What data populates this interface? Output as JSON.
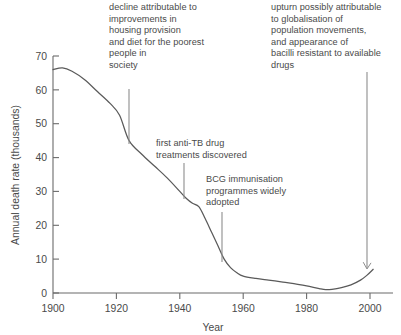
{
  "chart_data": {
    "type": "line",
    "title": "",
    "xlabel": "Year",
    "ylabel": "Annual death rate (thousands)",
    "xlim": [
      1900,
      2001
    ],
    "ylim": [
      0,
      70
    ],
    "grid": false,
    "legend": "none",
    "xticks": [
      "1900",
      "1920",
      "1940",
      "1960",
      "1980",
      "2000"
    ],
    "xtick_values": [
      1900,
      1920,
      1940,
      1960,
      1980,
      2000
    ],
    "yticks": [
      "0",
      "10",
      "20",
      "30",
      "40",
      "50",
      "60",
      "70"
    ],
    "ytick_values": [
      0,
      10,
      20,
      30,
      40,
      50,
      60,
      70
    ],
    "series": [
      {
        "name": "Annual death rate (thousands)",
        "x": [
          1900,
          1903,
          1906,
          1910,
          1914,
          1918,
          1921,
          1924,
          1928,
          1932,
          1936,
          1940,
          1942,
          1944,
          1946,
          1948,
          1950,
          1952,
          1954,
          1956,
          1958,
          1960,
          1964,
          1968,
          1972,
          1976,
          1980,
          1984,
          1986,
          1988,
          1991,
          1994,
          1997,
          1999,
          2001
        ],
        "values": [
          66.0,
          66.5,
          65.5,
          63.0,
          59.5,
          56.0,
          52.5,
          45.0,
          41.0,
          37.5,
          34.0,
          30.0,
          28.0,
          26.5,
          25.5,
          22.0,
          18.0,
          14.0,
          10.0,
          7.5,
          6.0,
          5.0,
          4.3,
          3.8,
          3.3,
          2.8,
          2.1,
          1.3,
          1.0,
          1.1,
          1.6,
          2.4,
          3.8,
          5.2,
          7.0
        ]
      }
    ],
    "annotations": [
      {
        "id": "housing",
        "text": "decline attributable to\nimprovements in\nhousing provision\nand diet for the poorest\npeople in\nsociety",
        "pointer_year": 1924,
        "pointer_value": 45
      },
      {
        "id": "antitb",
        "text": "first anti-TB drug\ntreatments discovered",
        "pointer_year": 1942,
        "pointer_value": 28
      },
      {
        "id": "bcg",
        "text": "BCG immunisation\nprogrammes widely\nadopted",
        "pointer_year": 1954,
        "pointer_value": 10
      },
      {
        "id": "upturn",
        "text": "upturn possibly attributable\nto globalisation of\npopulation movements,\nand appearance of\nbacilli resistant to available\ndrugs",
        "pointer_year": 2000,
        "pointer_value": 7
      }
    ],
    "colors": {
      "line": "#5a5a5a",
      "axis": "#6b6b6b",
      "text": "#4a4a4a",
      "leader": "#8d8d8d",
      "background": "#ffffff"
    }
  }
}
